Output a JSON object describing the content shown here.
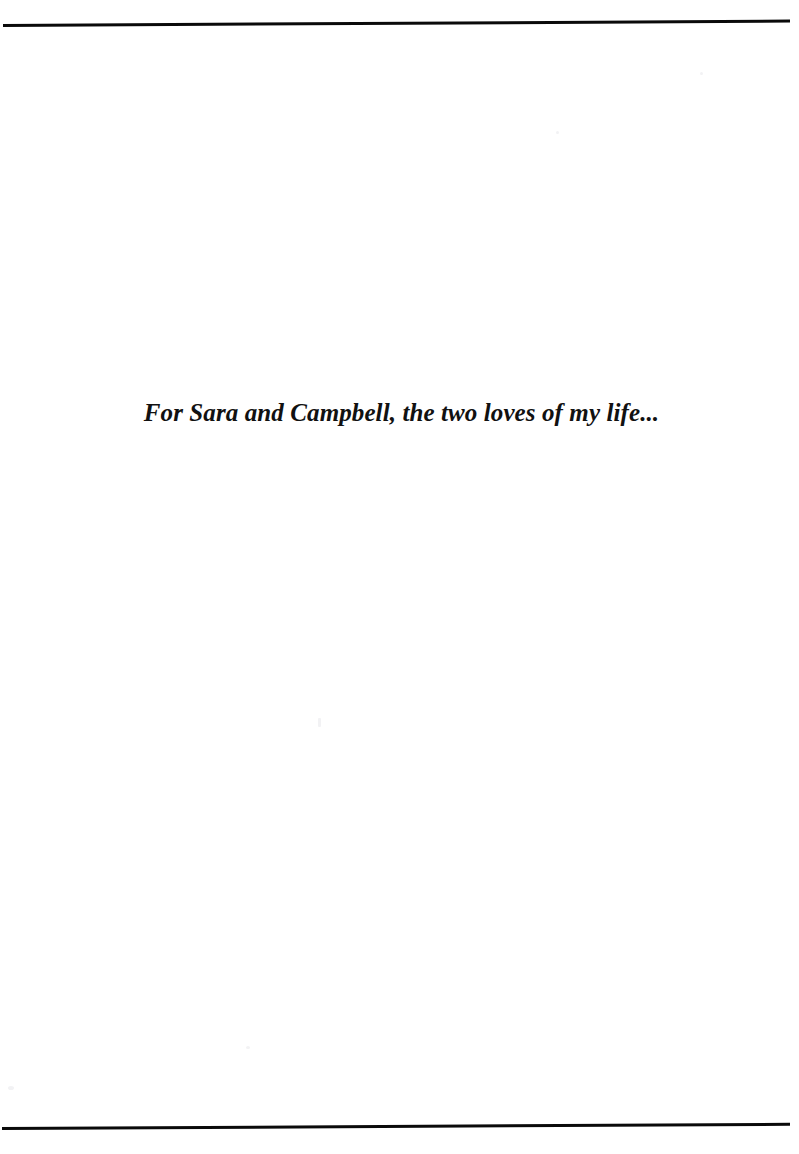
{
  "page": {
    "kind": "book-dedication-page",
    "background_color": "#ffffff",
    "width": 799,
    "height": 1154
  },
  "rules": {
    "color": "#0a0a0a",
    "top": {
      "label": "top-page-rule",
      "thickness": 3
    },
    "bottom": {
      "label": "bottom-page-rule",
      "thickness": 3
    }
  },
  "dedication": {
    "text": "For Sara and Campbell, the two loves of my life...",
    "style": "bold-italic-serif",
    "color": "#111111",
    "alignment": "center"
  }
}
